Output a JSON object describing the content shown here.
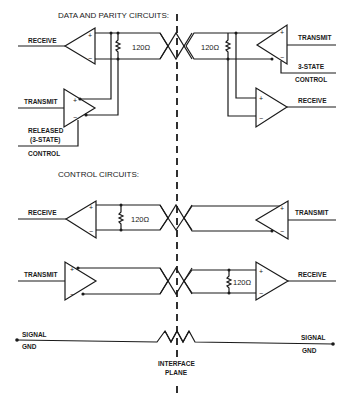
{
  "headings": {
    "data_parity": "DATA AND PARITY CIRCUITS:",
    "control": "CONTROL CIRCUITS:"
  },
  "data_parity": {
    "left": {
      "receive": "RECEIVE",
      "transmit": "TRANSMIT",
      "released_1": "RELEASED",
      "released_2": "(3-STATE)",
      "control": "CONTROL",
      "resistor": "120Ω"
    },
    "right": {
      "transmit": "TRANSMIT",
      "three_state": "3-STATE",
      "control": "CONTROL",
      "receive": "RECEIVE",
      "resistor": "120Ω"
    }
  },
  "control_circuits": {
    "top": {
      "left_label": "RECEIVE",
      "right_label": "TRANSMIT",
      "resistor": "120Ω"
    },
    "bottom": {
      "left_label": "TRANSMIT",
      "right_label": "RECEIVE",
      "resistor": "120Ω"
    }
  },
  "ground": {
    "left_1": "SIGNAL",
    "left_2": "GND",
    "right_1": "SIGNAL",
    "right_2": "GND"
  },
  "interface": {
    "line_1": "INTERFACE",
    "line_2": "PLANE"
  },
  "symbols": {
    "plus": "+",
    "minus": "−"
  }
}
